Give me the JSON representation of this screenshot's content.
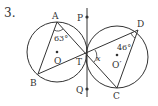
{
  "problem": {
    "number": "3.",
    "labels": {
      "A": "A",
      "B": "B",
      "C": "C",
      "D": "D",
      "P": "P",
      "Q": "Q",
      "T": "T",
      "O": "O",
      "O_prime": "O′",
      "x": "x"
    },
    "angles": {
      "angle_A": "63°",
      "angle_D": "46°"
    },
    "colors": {
      "stroke": "#333333",
      "background": "#ffffff"
    }
  }
}
